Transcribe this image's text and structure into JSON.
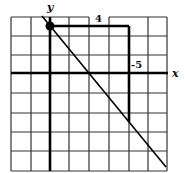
{
  "diagram": {
    "type": "coordinate-grid-line-slope",
    "grid": {
      "columns": 8,
      "rows": 8,
      "x_range": [
        -2,
        6
      ],
      "y_range": [
        -5,
        3
      ],
      "origin_column_index": 2,
      "origin_row_index": 3
    },
    "axes": {
      "x_label": "x",
      "y_label": "y"
    },
    "point": {
      "x": 0,
      "y": 2.5,
      "label": ""
    },
    "line": {
      "slope": -1.25,
      "y_intercept": 2.5,
      "slope_fraction": "-5/4"
    },
    "run_bracket": {
      "label": "4",
      "from_x": 0,
      "to_x": 4,
      "at_y": 2.5
    },
    "rise_bracket": {
      "label": "-5",
      "at_x": 4,
      "from_y": 2.5,
      "to_y": -2.5
    },
    "colors": {
      "grid": "#222222",
      "axis": "#000000",
      "line": "#000000",
      "background": "#ffffff"
    }
  }
}
